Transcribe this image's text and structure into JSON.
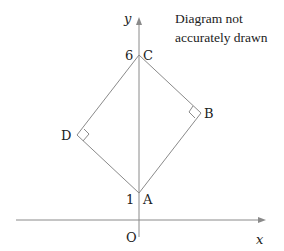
{
  "diagram": {
    "note_lines": [
      "Diagram not",
      "accurately drawn"
    ],
    "axes": {
      "x_label": "x",
      "y_label": "y",
      "origin_label": "O"
    },
    "y_ticks": [
      {
        "value": 6,
        "label": "6"
      },
      {
        "value": 1,
        "label": "1"
      }
    ],
    "points": [
      {
        "name": "A",
        "label": "A",
        "coords": [
          0,
          1
        ]
      },
      {
        "name": "B",
        "label": "B",
        "right_angle": true
      },
      {
        "name": "C",
        "label": "C",
        "coords": [
          0,
          6
        ]
      },
      {
        "name": "D",
        "label": "D",
        "right_angle": true
      }
    ],
    "edges": [
      [
        "A",
        "B"
      ],
      [
        "B",
        "C"
      ],
      [
        "C",
        "D"
      ],
      [
        "D",
        "A"
      ],
      [
        "A",
        "C"
      ]
    ],
    "colors": {
      "line": "#8a8a8a",
      "text": "#222222"
    }
  }
}
